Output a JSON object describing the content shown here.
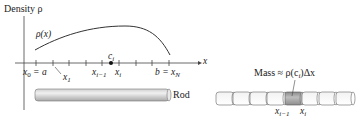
{
  "left_panel": {
    "y_axis_label": "Density ρ",
    "curve_label": "ρ(x)",
    "x_axis_label": "x",
    "sample_point_label": "c",
    "sample_point_sub": "i",
    "tick_labels": {
      "x0": "x",
      "x0_sub": "0",
      "x0_eq": " = a",
      "x1": "x",
      "x1_sub": "1",
      "xim1": "x",
      "xim1_sub": "i−1",
      "xi": "x",
      "xi_sub": "i",
      "b_eq": "b = x",
      "xN_sub": "N"
    },
    "rod_label": "Rod"
  },
  "right_panel": {
    "mass_label": "Mass ≈ ρ(c",
    "mass_sub": "i",
    "mass_tail": ")Δx",
    "segment_count": 8,
    "highlighted_segment": 5,
    "left_label": "x",
    "left_sub": "i−1",
    "right_label": "x",
    "right_sub": "i"
  },
  "colors": {
    "line": "#333333",
    "rod_fill_light": "#e6e6e6",
    "rod_fill_dark": "#a9a9a9",
    "highlight": "#9c9c9c"
  }
}
